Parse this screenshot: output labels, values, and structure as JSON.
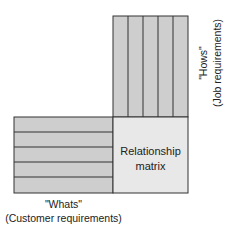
{
  "diagram": {
    "type": "QFD house-of-quality simplified",
    "colors": {
      "block_fill": "#cecece",
      "matrix_fill": "#e8e8e8",
      "line": "#333333"
    },
    "whats": {
      "title": "\"Whats\"",
      "subtitle": "(Customer requirements)",
      "rows": 5
    },
    "hows": {
      "title": "\"Hows\"",
      "subtitle": "(Job requirements)",
      "columns": 5
    },
    "matrix": {
      "line1": "Relationship",
      "line2": "matrix"
    }
  }
}
